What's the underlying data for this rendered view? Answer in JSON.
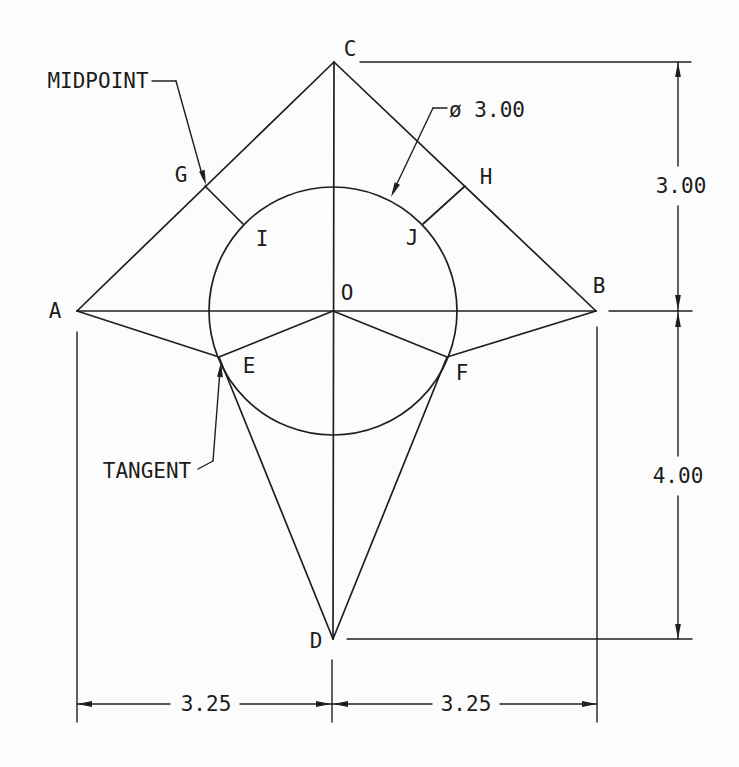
{
  "style": {
    "width": 739,
    "height": 767,
    "background": "#fcfcfc",
    "line_color": "#1f1f1f",
    "text_color": "#1c1c1c",
    "shape_stroke": 1.7,
    "dim_stroke": 1.4,
    "font_size": 21,
    "arrow_length": 15,
    "arrow_half_width": 2.9
  },
  "figure": {
    "circle": {
      "cx": 333,
      "cy": 311,
      "r": 124,
      "diameter_label": "ø 3.00"
    },
    "shape_edges": [
      [
        77,
        311,
        334,
        62
      ],
      [
        334,
        62,
        596,
        311
      ],
      [
        77,
        311,
        596,
        311
      ],
      [
        334,
        62,
        333,
        639
      ],
      [
        77,
        311,
        219,
        357
      ],
      [
        333,
        311,
        219,
        357
      ],
      [
        219,
        357,
        333,
        639
      ],
      [
        596,
        311,
        447,
        357
      ],
      [
        333,
        311,
        447,
        357
      ],
      [
        447,
        357,
        333,
        639
      ],
      [
        205,
        186,
        243,
        224
      ],
      [
        465,
        186,
        423,
        224
      ]
    ],
    "extension_lines": [
      [
        360,
        62,
        691,
        62
      ],
      [
        609,
        311,
        692,
        311
      ],
      [
        347,
        639,
        692,
        639
      ],
      [
        77,
        332,
        77,
        722
      ],
      [
        332,
        660,
        332,
        722
      ],
      [
        597,
        327,
        597,
        722
      ]
    ],
    "dimension_lines": [
      [
        678,
        62,
        678,
        166
      ],
      [
        678,
        206,
        678,
        311
      ],
      [
        678,
        311,
        678,
        456
      ],
      [
        678,
        496,
        678,
        639
      ],
      [
        77,
        704,
        170,
        704
      ],
      [
        240,
        704,
        332,
        704
      ],
      [
        332,
        704,
        432,
        704
      ],
      [
        500,
        704,
        597,
        704
      ]
    ],
    "leader_lines": [
      [
        152,
        81,
        176,
        81
      ],
      [
        176,
        81,
        203,
        178
      ],
      [
        198,
        469,
        213,
        461
      ],
      [
        213,
        461,
        220,
        370
      ],
      [
        447,
        108,
        433,
        108
      ],
      [
        433,
        108,
        393,
        192
      ]
    ],
    "arrowheads": [
      {
        "tip": [
          678,
          62
        ],
        "angle": -90
      },
      {
        "tip": [
          678,
          310
        ],
        "angle": 90
      },
      {
        "tip": [
          678,
          312
        ],
        "angle": -90
      },
      {
        "tip": [
          678,
          639
        ],
        "angle": 90
      },
      {
        "tip": [
          77,
          704
        ],
        "angle": 180
      },
      {
        "tip": [
          331,
          704
        ],
        "angle": 0
      },
      {
        "tip": [
          333,
          704
        ],
        "angle": 180
      },
      {
        "tip": [
          597,
          704
        ],
        "angle": 0
      },
      {
        "tip": [
          206,
          185
        ],
        "angle": 74
      },
      {
        "tip": [
          221,
          362
        ],
        "angle": -86
      },
      {
        "tip": [
          391,
          197
        ],
        "angle": 115
      }
    ]
  },
  "labels": {
    "vertices": [
      {
        "text": "A",
        "x": 55,
        "y": 318
      },
      {
        "text": "B",
        "x": 599,
        "y": 293
      },
      {
        "text": "C",
        "x": 350,
        "y": 56
      },
      {
        "text": "D",
        "x": 316,
        "y": 648
      },
      {
        "text": "O",
        "x": 347,
        "y": 300
      },
      {
        "text": "E",
        "x": 249,
        "y": 373
      },
      {
        "text": "F",
        "x": 462,
        "y": 380
      },
      {
        "text": "G",
        "x": 181,
        "y": 182
      },
      {
        "text": "H",
        "x": 486,
        "y": 184
      },
      {
        "text": "I",
        "x": 262,
        "y": 246
      },
      {
        "text": "J",
        "x": 412,
        "y": 245
      }
    ],
    "dimensions": [
      {
        "text": "3.00",
        "x": 681,
        "y": 193
      },
      {
        "text": "4.00",
        "x": 678,
        "y": 483
      },
      {
        "text": "3.25",
        "x": 206,
        "y": 711
      },
      {
        "text": "3.25",
        "x": 466,
        "y": 711
      },
      {
        "text": "ø 3.00",
        "x": 487,
        "y": 117
      }
    ],
    "annotations": [
      {
        "text": "MIDPOINT",
        "x": 98,
        "y": 88
      },
      {
        "text": "TANGENT",
        "x": 147,
        "y": 478
      }
    ]
  }
}
